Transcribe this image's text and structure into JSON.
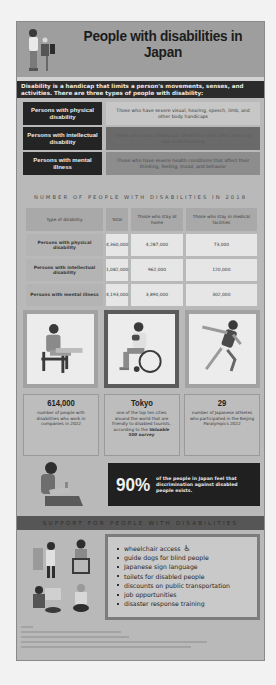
{
  "header": {
    "title": "People with disabilities in Japan"
  },
  "intro": "Disability is a handicap that limits a person's movements, senses, and activities. There are three types of people with disability:",
  "types": [
    {
      "label": "Persons with physical disability",
      "description": "Those who have severe visual, hearing, speech, limb, and other body handicaps"
    },
    {
      "label": "Persons with intellectual disability",
      "description": "Those who have intellectual disabilities that affect learning and understanding"
    },
    {
      "label": "Persons with mental illness",
      "description": "Those who have severe health conditions that affect their thinking, feeling, mood, and behavior"
    }
  ],
  "table": {
    "title": "NUMBER OF PEOPLE WITH DISABILITIES IN 2018",
    "headers": [
      "Type of disability",
      "Total",
      "Those who stay at home",
      "Those who stay in medical facilities"
    ],
    "rows": [
      [
        "Persons with physical disability",
        "4,360,000",
        "4,287,000",
        "73,000"
      ],
      [
        "Persons with intellectual disability",
        "1,082,000",
        "962,000",
        "120,000"
      ],
      [
        "Persons with mental illness",
        "4,193,000",
        "3,890,000",
        "302,000"
      ]
    ]
  },
  "images": [
    {
      "name": "person-seated-working"
    },
    {
      "name": "person-in-wheelchair"
    },
    {
      "name": "paralympic-runner"
    }
  ],
  "stats": [
    {
      "value": "614,000",
      "text": "number of people with disabilities who work in companies in 2022"
    },
    {
      "value": "Tokyo",
      "text": "one of the top ten cities around the world that are friendly to disabled tourists, according to the",
      "emphasis": "Valuable 500 survey"
    },
    {
      "value": "29",
      "text": "number of Japanese athletes who participated in the Beijing Paralympics 2022"
    }
  ],
  "callout": {
    "value": "90%",
    "text": "of the people in Japan feel that discrimination against disabled people exists."
  },
  "support": {
    "title": "SUPPORT FOR PEOPLE WITH DISABILITIES",
    "items": [
      "wheelchair access",
      "guide dogs for blind people",
      "Japanese sign language",
      "toilets for disabled people",
      "discounts on public transportation",
      "job opportunities",
      "disaster response training"
    ],
    "wheelchair_icon": "♿"
  },
  "colors": {
    "background": "#b9b9b9",
    "header": "#9e9e9e",
    "dark_panel": "#242424"
  }
}
